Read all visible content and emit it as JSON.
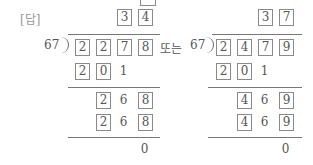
{
  "answer_label": "[답]",
  "connector": "또는",
  "left": {
    "divisor": "67",
    "quotient": [
      "3",
      "4"
    ],
    "dividend": [
      "2",
      "2",
      "7",
      "8"
    ],
    "step1": [
      "2",
      "0",
      "1"
    ],
    "step2a": [
      "2",
      "6",
      "8"
    ],
    "step2b": [
      "2",
      "6",
      "8"
    ],
    "remainder": "0"
  },
  "right": {
    "divisor": "67",
    "quotient": [
      "3",
      "7"
    ],
    "dividend": [
      "2",
      "4",
      "7",
      "9"
    ],
    "step1": [
      "2",
      "0",
      "1"
    ],
    "step2a": [
      "4",
      "6",
      "9"
    ],
    "step2b": [
      "4",
      "6",
      "9"
    ],
    "remainder": "0"
  }
}
